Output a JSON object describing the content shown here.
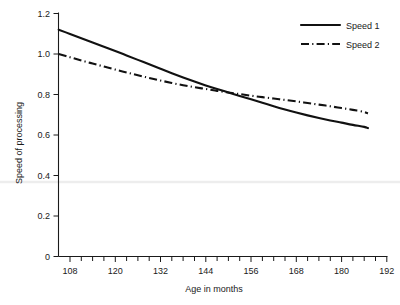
{
  "chart_data": {
    "type": "line",
    "title": "",
    "subtitle": "",
    "xlabel": "Age in months",
    "ylabel": "Speed of processing",
    "xlim": [
      105,
      192
    ],
    "ylim": [
      0,
      1.2
    ],
    "xticks": [
      108,
      120,
      132,
      144,
      156,
      168,
      180,
      192
    ],
    "xtick_labels": [
      "108",
      "120",
      "132",
      "144",
      "156",
      "168",
      "180",
      "192"
    ],
    "xminor_step": 3,
    "yticks": [
      0,
      0.2,
      0.4,
      0.6,
      0.8,
      1.0,
      1.2
    ],
    "ytick_labels": [
      "0",
      "0.2",
      "0.4",
      "0.6",
      "0.8",
      "1.0",
      "1.2"
    ],
    "grid": false,
    "legend_position": "top-right",
    "x": [
      105,
      108,
      111,
      114,
      117,
      120,
      123,
      126,
      129,
      132,
      135,
      138,
      141,
      144,
      147,
      150,
      153,
      156,
      159,
      162,
      165,
      168,
      171,
      174,
      177,
      180,
      183,
      186,
      187
    ],
    "series": [
      {
        "name": "Speed 1",
        "style": "solid",
        "color": "#111111",
        "values": [
          1.12,
          1.099,
          1.078,
          1.057,
          1.036,
          1.015,
          0.993,
          0.971,
          0.949,
          0.927,
          0.905,
          0.884,
          0.864,
          0.845,
          0.827,
          0.81,
          0.793,
          0.776,
          0.759,
          0.742,
          0.726,
          0.711,
          0.697,
          0.684,
          0.672,
          0.661,
          0.65,
          0.64,
          0.634
        ]
      },
      {
        "name": "Speed 2",
        "style": "dash-dot",
        "color": "#111111",
        "values": [
          1.0,
          0.984,
          0.968,
          0.953,
          0.938,
          0.923,
          0.909,
          0.895,
          0.882,
          0.869,
          0.857,
          0.846,
          0.836,
          0.827,
          0.818,
          0.81,
          0.802,
          0.794,
          0.787,
          0.78,
          0.773,
          0.766,
          0.758,
          0.75,
          0.742,
          0.733,
          0.724,
          0.714,
          0.706
        ]
      }
    ],
    "annotations": []
  },
  "legend": {
    "entries": [
      {
        "label": "Speed 1",
        "style": "solid"
      },
      {
        "label": "Speed 2",
        "style": "dash-dot"
      }
    ]
  },
  "axes": {
    "x_title": "Age in months",
    "y_title": "Speed of processing"
  },
  "colors": {
    "ink": "#111111",
    "axis": "#1a1a1a",
    "background": "#ffffff",
    "artifact": "#ededed"
  }
}
